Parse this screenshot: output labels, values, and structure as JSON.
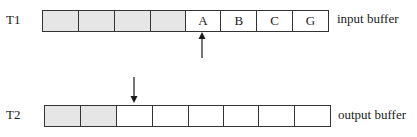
{
  "tapes": [
    {
      "label": "T1",
      "caption": "input buffer",
      "cells": [
        {
          "value": "",
          "state": "used"
        },
        {
          "value": "",
          "state": "used"
        },
        {
          "value": "",
          "state": "used"
        },
        {
          "value": "",
          "state": "used"
        },
        {
          "value": "A",
          "state": "empty"
        },
        {
          "value": "B",
          "state": "empty"
        },
        {
          "value": "C",
          "state": "empty"
        },
        {
          "value": "G",
          "state": "empty"
        }
      ],
      "pointer": {
        "cell_index": 4,
        "direction": "up"
      }
    },
    {
      "label": "T2",
      "caption": "output buffer",
      "cells": [
        {
          "value": "",
          "state": "used"
        },
        {
          "value": "",
          "state": "used"
        },
        {
          "value": "",
          "state": "empty"
        },
        {
          "value": "",
          "state": "empty"
        },
        {
          "value": "",
          "state": "empty"
        },
        {
          "value": "",
          "state": "empty"
        },
        {
          "value": "",
          "state": "empty"
        },
        {
          "value": "",
          "state": "empty"
        }
      ],
      "pointer": {
        "cell_index": 2,
        "direction": "down"
      }
    }
  ],
  "colors": {
    "used_cell": "#e6e6e6",
    "empty_cell": "#ffffff",
    "stroke": "#333333"
  }
}
